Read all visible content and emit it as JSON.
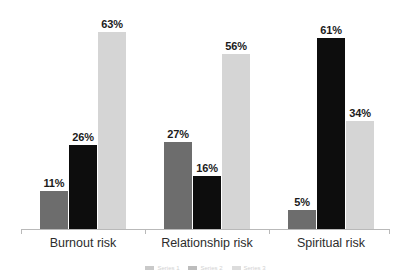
{
  "chart_data": {
    "type": "bar",
    "title": "",
    "subtitle": "",
    "xlabel": "",
    "ylabel": "",
    "ylim": [
      0,
      70
    ],
    "grid": false,
    "legend_position": "bottom",
    "value_suffix": "%",
    "categories": [
      "Burnout risk",
      "Relationship risk",
      "Spiritual risk"
    ],
    "series": [
      {
        "name": "Series 1",
        "color": "#6d6d6d",
        "values": [
          11,
          26,
          63
        ]
      },
      {
        "name": "Series 2",
        "color": "#0d0d0d",
        "values": [
          27,
          16,
          56
        ]
      },
      {
        "name": "Series 3",
        "color": "#d5d5d5",
        "values": [
          5,
          61,
          34
        ]
      }
    ],
    "bars": [
      {
        "group": "Burnout risk",
        "series": 0,
        "value": 11,
        "label": "11%",
        "color": "#6d6d6d"
      },
      {
        "group": "Burnout risk",
        "series": 1,
        "value": 26,
        "label": "26%",
        "color": "#0d0d0d"
      },
      {
        "group": "Burnout risk",
        "series": 2,
        "value": 63,
        "label": "63%",
        "color": "#d5d5d5"
      },
      {
        "group": "Relationship risk",
        "series": 0,
        "value": 27,
        "label": "27%",
        "color": "#6d6d6d"
      },
      {
        "group": "Relationship risk",
        "series": 1,
        "value": 16,
        "label": "16%",
        "color": "#0d0d0d"
      },
      {
        "group": "Relationship risk",
        "series": 2,
        "value": 56,
        "label": "56%",
        "color": "#d5d5d5"
      },
      {
        "group": "Spiritual risk",
        "series": 0,
        "value": 5,
        "label": "5%",
        "color": "#6d6d6d"
      },
      {
        "group": "Spiritual risk",
        "series": 1,
        "value": 61,
        "label": "61%",
        "color": "#0d0d0d"
      },
      {
        "group": "Spiritual risk",
        "series": 2,
        "value": 34,
        "label": "34%",
        "color": "#d5d5d5"
      }
    ],
    "axis_color": "#b9b9b9",
    "label_color": "#1b1b1b",
    "category_color": "#2c2c2c",
    "background": "#ffffff"
  },
  "groups": [
    {
      "label": "Burnout risk",
      "labelLeft": 40,
      "bars": [
        {
          "left": 40,
          "value": 11,
          "label": "11%",
          "series": 0
        },
        {
          "left": 69,
          "value": 26,
          "label": "26%",
          "series": 1
        },
        {
          "left": 98,
          "value": 63,
          "label": "63%",
          "series": 2
        }
      ]
    },
    {
      "label": "Relationship risk",
      "labelLeft": 164,
      "bars": [
        {
          "left": 164,
          "value": 27,
          "label": "27%",
          "series": 0
        },
        {
          "left": 193,
          "value": 16,
          "label": "16%",
          "series": 1
        },
        {
          "left": 222,
          "value": 56,
          "label": "56%",
          "series": 2
        }
      ]
    },
    {
      "label": "Spiritual risk",
      "labelLeft": 288,
      "bars": [
        {
          "left": 288,
          "value": 5,
          "label": "5%",
          "series": 0
        },
        {
          "left": 317,
          "value": 61,
          "label": "61%",
          "series": 1
        },
        {
          "left": 346,
          "value": 34,
          "label": "34%",
          "series": 2
        }
      ]
    }
  ],
  "ticks": [
    21,
    145,
    269,
    389
  ],
  "legend": {
    "items": [
      {
        "text": "Series 1"
      },
      {
        "text": "Series 2"
      },
      {
        "text": "Series 3"
      }
    ]
  }
}
